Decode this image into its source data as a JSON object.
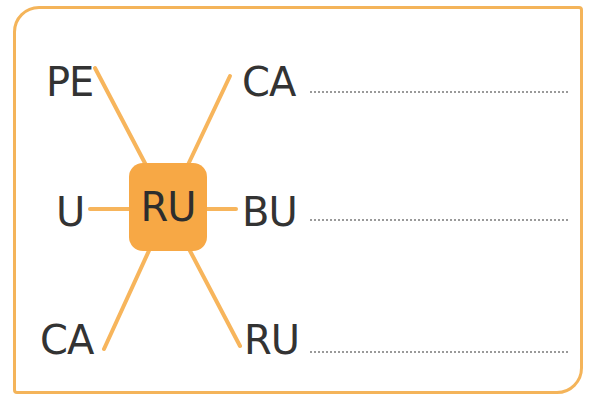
{
  "exercise": {
    "center_syllable": "RU",
    "left_syllables": [
      "PE",
      "U",
      "CA"
    ],
    "right_syllables": [
      "CA",
      "BU",
      "RU"
    ],
    "answer_lines": [
      "",
      "",
      ""
    ],
    "colors": {
      "accent": "#f7a845",
      "border": "#f4b45a",
      "text": "#333333",
      "answer_line": "#9a9a9a"
    }
  }
}
